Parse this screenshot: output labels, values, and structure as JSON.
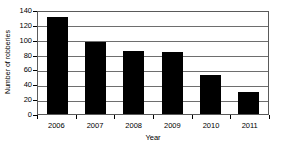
{
  "chart_data": {
    "type": "bar",
    "title": "",
    "xlabel": "Year",
    "ylabel": "Number of robberies",
    "categories": [
      "2006",
      "2007",
      "2008",
      "2009",
      "2010",
      "2011"
    ],
    "values": [
      130,
      97,
      85,
      83,
      52,
      29
    ],
    "ylim": [
      0,
      140
    ],
    "yticks": [
      0,
      20,
      40,
      60,
      80,
      100,
      120,
      140
    ],
    "ytick_labels": [
      "0",
      "20",
      "40",
      "60",
      "80",
      "100",
      "120",
      "140"
    ],
    "grid": true,
    "grid_axis": "y",
    "legend": false,
    "bar_color": "#000000",
    "grid_color": "#6e6e6e",
    "axis_color": "#5a5a5a",
    "background_color": "#ffffff",
    "series": [
      {
        "name": "Number of robberies",
        "values": [
          130,
          97,
          85,
          83,
          52,
          29
        ]
      }
    ]
  }
}
